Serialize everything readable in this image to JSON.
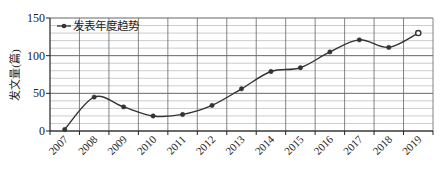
{
  "chart_data": {
    "type": "line",
    "title": "",
    "xlabel": "",
    "ylabel": "发文量(篇)",
    "categories": [
      "2007",
      "2008",
      "2009",
      "2010",
      "2011",
      "2012",
      "2013",
      "2014",
      "2015",
      "2016",
      "2017",
      "2018",
      "2019"
    ],
    "series": [
      {
        "name": "发表年度趋势",
        "values": [
          2,
          45,
          32,
          20,
          22,
          34,
          56,
          79,
          84,
          105,
          121,
          111,
          130
        ],
        "smooth": true,
        "marker": "circle",
        "last_point_marker": "hollow-circle",
        "color": "#333333"
      }
    ],
    "ylim": [
      0,
      150
    ],
    "yticks": [
      0,
      50,
      100,
      150
    ],
    "minor_gridlines_step": 10,
    "grid": true,
    "legend": {
      "position": "top-left-inside",
      "entries": [
        "发表年度趋势"
      ]
    },
    "xtick_rotation": -45
  }
}
